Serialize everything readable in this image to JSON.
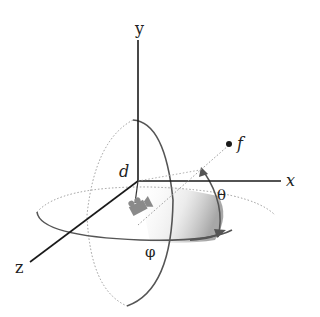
{
  "diagram": {
    "axes": {
      "x": "x",
      "y": "y",
      "z": "z"
    },
    "labels": {
      "distance": "d",
      "focus": "f",
      "elevation": "θ",
      "azimuth": "φ"
    },
    "icons": {
      "camera": "camera-icon",
      "focus_point": "point-icon"
    },
    "colors": {
      "axis": "#1a1a1a",
      "circle": "#555555",
      "dotted": "#9a9a9a",
      "camera": "#8a8a8a",
      "shading": "#b0b0b0"
    }
  }
}
